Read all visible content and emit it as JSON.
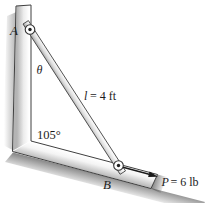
{
  "figure": {
    "type": "statics-problem-diagram",
    "labels": {
      "point_a": "A",
      "point_b": "B",
      "theta": "θ",
      "length_var": "l",
      "length_value": "= 4 ft",
      "corner_angle": "105°",
      "force_var": "P",
      "force_value": "= 6 lb"
    },
    "colors": {
      "outline": "#3f3f3f",
      "bar_fill_light": "#f2f2f2",
      "bar_fill_dark": "#a6a6a6",
      "shadow": "#5f5f5f",
      "surface_fill": "#ffffff"
    }
  }
}
